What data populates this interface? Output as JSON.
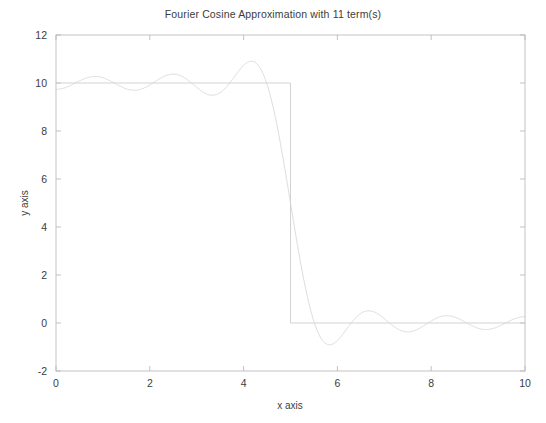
{
  "figure": {
    "title": "Fourier Cosine Approximation with 11 term(s)",
    "background_color": "#ffffff"
  },
  "chart_data": {
    "type": "line",
    "title": "Fourier Cosine Approximation with 11 term(s)",
    "xlabel": "x axis",
    "ylabel": "y axis",
    "xlim": [
      0,
      10
    ],
    "ylim": [
      -2,
      12
    ],
    "xticks": [
      0,
      2,
      4,
      6,
      8,
      10
    ],
    "yticks": [
      -2,
      0,
      2,
      4,
      6,
      8,
      10,
      12
    ],
    "xtick_labels": [
      "0",
      "2",
      "4",
      "6",
      "8",
      "10"
    ],
    "ytick_labels": [
      "-2",
      "0",
      "2",
      "4",
      "6",
      "8",
      "10",
      "12"
    ],
    "grid": false,
    "legend": "none",
    "box": true,
    "tick_direction": "in",
    "series": [
      {
        "name": "square-wave-target",
        "kind": "step",
        "color": "#c8c8c8",
        "line_width": 0.8,
        "description": "Square wave: y = 10 for 0 <= x < 5, y = 0 for 5 <= x <= 10",
        "amplitude": 10,
        "step_x": 5,
        "low_value": 0,
        "x": [
          0,
          5,
          5,
          10
        ],
        "y": [
          10,
          10,
          0,
          0
        ]
      },
      {
        "name": "fourier-cosine-approximation",
        "kind": "curve",
        "color": "#d2d2d2",
        "line_width": 0.8,
        "description": "Partial sum of Fourier cosine series for the square wave, 11 terms, showing Gibbs phenomenon",
        "n_terms": 11,
        "half_period_L": 10,
        "mean_value": 5,
        "formula": "y(x) = 5 + sum_{n=1..11} (20/(n*pi)) * sin(n*pi*0.5) * cos(n*pi*x/10)",
        "key_points": [
          {
            "x": 0.0,
            "y": 11.4
          },
          {
            "x": 0.45,
            "y": 10.0
          },
          {
            "x": 1.2,
            "y": 9.45
          },
          {
            "x": 2.05,
            "y": 10.5
          },
          {
            "x": 3.0,
            "y": 9.4
          },
          {
            "x": 4.05,
            "y": 11.0
          },
          {
            "x": 5.0,
            "y": 5.0
          },
          {
            "x": 5.95,
            "y": -0.9
          },
          {
            "x": 7.0,
            "y": 0.55
          },
          {
            "x": 8.0,
            "y": -0.3
          },
          {
            "x": 9.0,
            "y": 0.15
          },
          {
            "x": 10.0,
            "y": -0.15
          }
        ],
        "gibbs_overshoot_max": 11.4,
        "gibbs_undershoot_min": -0.9
      }
    ]
  }
}
